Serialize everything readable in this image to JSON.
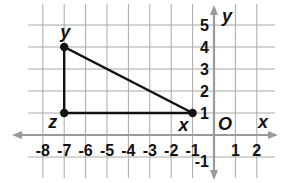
{
  "chart_data": {
    "type": "diagram",
    "title": "",
    "grid": true,
    "xlabel": "x",
    "ylabel": "y",
    "origin_label": "O",
    "xlim": [
      -8.5,
      2.8
    ],
    "ylim": [
      -1.9,
      5.5
    ],
    "x_ticks": [
      "-8",
      "-7",
      "-6",
      "-5",
      "-4",
      "-3",
      "-2",
      "-1",
      "1",
      "2"
    ],
    "y_ticks": [
      "5",
      "4",
      "3",
      "2",
      "1",
      "-1"
    ],
    "points": [
      {
        "label": "y",
        "x": -7,
        "y": 4
      },
      {
        "label": "z",
        "x": -7,
        "y": 1
      },
      {
        "label": "x",
        "x": -1,
        "y": 1
      }
    ],
    "polygon": [
      "y",
      "z",
      "x"
    ],
    "colors": {
      "grid": "#9a9a9a",
      "axis": "#9a9a9a",
      "shape": "#111111"
    }
  }
}
